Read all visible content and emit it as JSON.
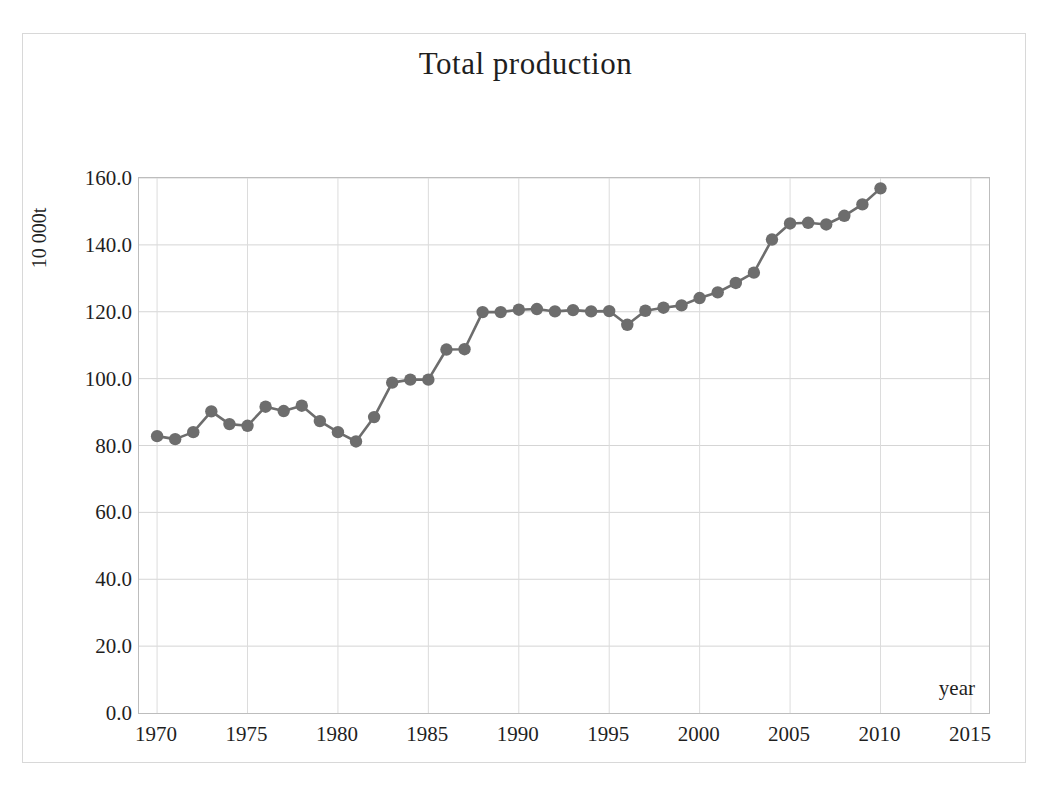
{
  "chart_data": {
    "type": "line",
    "title": "Total production",
    "xlabel": "year",
    "ylabel": "10 000t",
    "xlim": [
      1969,
      2016
    ],
    "ylim": [
      0,
      160
    ],
    "xticks": [
      1970,
      1975,
      1980,
      1985,
      1990,
      1995,
      2000,
      2005,
      2010,
      2015
    ],
    "yticks": [
      "0.0",
      "20.0",
      "40.0",
      "60.0",
      "80.0",
      "100.0",
      "120.0",
      "140.0",
      "160.0"
    ],
    "ytick_values": [
      0,
      20,
      40,
      60,
      80,
      100,
      120,
      140,
      160
    ],
    "grid": true,
    "legend": null,
    "marker": "circle",
    "series": [
      {
        "name": "Total production",
        "color": "#6d6d6d",
        "x": [
          1970,
          1971,
          1972,
          1973,
          1974,
          1975,
          1976,
          1977,
          1978,
          1979,
          1980,
          1981,
          1982,
          1983,
          1984,
          1985,
          1986,
          1987,
          1988,
          1989,
          1990,
          1991,
          1992,
          1993,
          1994,
          1995,
          1996,
          1997,
          1998,
          1999,
          2000,
          2001,
          2002,
          2003,
          2004,
          2005,
          2006,
          2007,
          2008,
          2009,
          2010
        ],
        "values": [
          82.8,
          81.9,
          84.0,
          90.2,
          86.4,
          85.9,
          91.6,
          90.3,
          91.9,
          87.3,
          84.0,
          81.2,
          88.5,
          98.8,
          99.7,
          99.7,
          108.7,
          108.8,
          119.9,
          119.9,
          120.6,
          120.8,
          120.1,
          120.5,
          120.1,
          120.2,
          116.1,
          120.3,
          121.2,
          121.9,
          124.1,
          125.8,
          128.6,
          131.7,
          141.6,
          146.4,
          146.6,
          146.1,
          148.7,
          152.1,
          156.9
        ]
      }
    ]
  }
}
